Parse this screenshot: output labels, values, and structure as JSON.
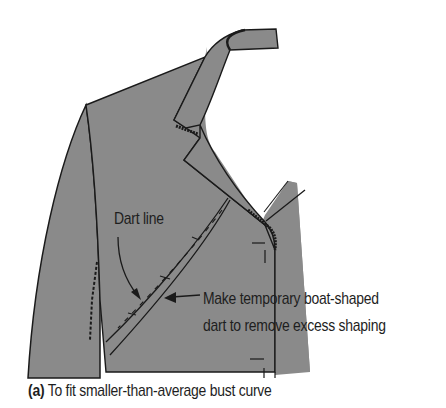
{
  "figure": {
    "fill_color": "#8a8a8a",
    "line_color": "#1a1a1a",
    "background": "#ffffff"
  },
  "labels": {
    "dart_line": "Dart line",
    "boat_dart_line1": "Make temporary boat-shaped",
    "boat_dart_line2": "dart to remove excess shaping"
  },
  "caption": {
    "prefix": "(a)",
    "text": " To fit smaller-than-average bust curve"
  }
}
